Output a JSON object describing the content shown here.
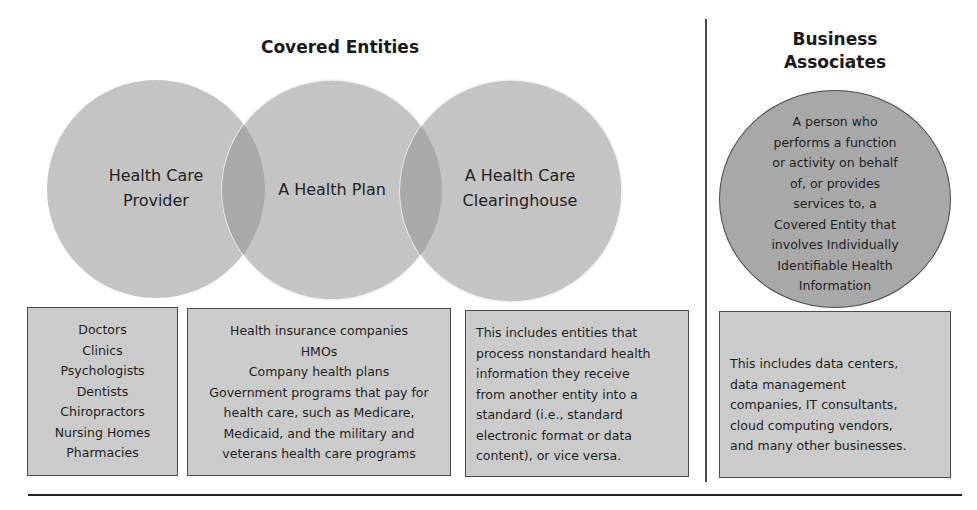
{
  "covered_entities": {
    "title": "Covered Entities",
    "circles": [
      {
        "label_lines": [
          "Health Care",
          "Provider"
        ]
      },
      {
        "label_lines": [
          "A Health Plan"
        ]
      },
      {
        "label_lines": [
          "A Health Care",
          "Clearinghouse"
        ]
      }
    ],
    "boxes": [
      {
        "lines": [
          "Doctors",
          "Clinics",
          "Psychologists",
          "Dentists",
          "Chiropractors",
          "Nursing Homes",
          "Pharmacies"
        ]
      },
      {
        "lines": [
          "Health insurance companies",
          "HMOs",
          "Company health plans",
          "Government programs that pay for",
          "health care, such as Medicare,",
          "Medicaid, and the military and",
          "veterans health care programs"
        ]
      },
      {
        "lines": [
          "This includes entities that",
          "process nonstandard health",
          "information they receive",
          "from another entity into a",
          "standard (i.e., standard",
          "electronic format or data",
          "content), or vice versa."
        ]
      }
    ]
  },
  "business_associates": {
    "title_lines": [
      "Business",
      "Associates"
    ],
    "circle_lines": [
      "A person who",
      "performs a function",
      "or activity on behalf",
      "of, or provides",
      "services to, a",
      "Covered Entity that",
      "involves Individually",
      "Identifiable Health",
      "Information"
    ],
    "box_lines": [
      "This includes data centers,",
      "data management",
      "companies, IT consultants,",
      "cloud computing vendors,",
      "and many other businesses."
    ]
  },
  "colors": {
    "circle_fill": "#c4c4c4",
    "overlap_fill": "#a9a9a9",
    "ba_circle_fill": "#a8a8a8",
    "box_fill": "#cbcbcb",
    "border": "#4a4a4a"
  }
}
